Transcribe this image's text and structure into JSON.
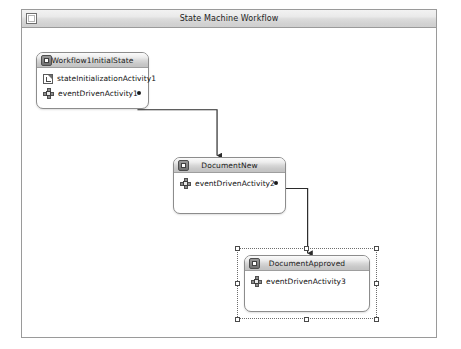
{
  "window": {
    "title": "State Machine Workflow",
    "icon": "window-restore-icon"
  },
  "canvas": {
    "states": [
      {
        "id": "workflow1InitialState",
        "title": "Workflow1InitialState",
        "icon": "state-icon",
        "selected": false,
        "activities": [
          {
            "label": "stateInitializationActivity1",
            "icon": "state-initialization-icon",
            "has_anchor": false
          },
          {
            "label": "eventDrivenActivity1",
            "icon": "event-driven-icon",
            "has_anchor": true
          }
        ]
      },
      {
        "id": "documentNew",
        "title": "DocumentNew",
        "icon": "state-icon",
        "selected": false,
        "activities": [
          {
            "label": "eventDrivenActivity2",
            "icon": "event-driven-icon",
            "has_anchor": true
          }
        ]
      },
      {
        "id": "documentApproved",
        "title": "DocumentApproved",
        "icon": "state-icon",
        "selected": true,
        "activities": [
          {
            "label": "eventDrivenActivity3",
            "icon": "event-driven-icon",
            "has_anchor": false
          }
        ]
      }
    ],
    "connectors": [
      {
        "id": "conn-initial-to-new",
        "from": "eventDrivenActivity1",
        "to": "DocumentNew"
      },
      {
        "id": "conn-new-to-approved",
        "from": "eventDrivenActivity2",
        "to": "DocumentApproved"
      }
    ]
  },
  "colors": {
    "window_border": "#9a9a9a",
    "title_bar_text": "#1d1d1d",
    "connector_line": "#2b2b2b",
    "state_border": "#8c8c8c",
    "selection_handle": "#4a4a4a"
  }
}
